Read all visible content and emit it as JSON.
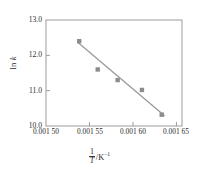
{
  "chart_data": {
    "type": "scatter",
    "title": "",
    "subtitle": "",
    "xlabel": "1/T /K^-1",
    "xlabel_parts": {
      "numerator": "1",
      "denominator": "T",
      "unit": "/K",
      "unit_exponent": "−1"
    },
    "ylabel": "ln k",
    "ylabel_parts": {
      "prefix": "ln ",
      "symbol": "k"
    },
    "xlim": [
      0.0015,
      0.0016564
    ],
    "ylim": [
      10.0,
      13.0
    ],
    "grid": false,
    "legend": null,
    "xticks": [
      0.0015,
      0.00155,
      0.0016,
      0.00165
    ],
    "xtick_labels": [
      "0.001 50",
      "0.001 55",
      "0.001 60",
      "0.001 65"
    ],
    "yticks": [
      10.0,
      11.0,
      12.0,
      13.0
    ],
    "ytick_labels": [
      "10.0",
      "11.0",
      "12.0",
      "13.0"
    ],
    "x": [
      0.0015382,
      0.0015595,
      0.0015824,
      0.0016103,
      0.0016331
    ],
    "y": [
      12.4,
      11.6,
      11.3,
      11.02,
      10.32
    ],
    "series": [
      {
        "name": "data",
        "marker": "square",
        "marker_color": "#8c8c8c",
        "x": [
          0.0015382,
          0.0015595,
          0.0015824,
          0.0016103,
          0.0016331
        ],
        "y": [
          12.4,
          11.6,
          11.3,
          11.02,
          10.32
        ]
      },
      {
        "name": "fit-line",
        "type": "line",
        "line_color": "#9a9a9a",
        "x": [
          0.0015368,
          0.001636
        ],
        "y": [
          12.36,
          10.3
        ]
      }
    ],
    "colors": {
      "axis": "#9b9b9b",
      "text": "#2b2b2b",
      "marker": "#8c8c8c",
      "line": "#9a9a9a",
      "background": "#ffffff"
    }
  }
}
